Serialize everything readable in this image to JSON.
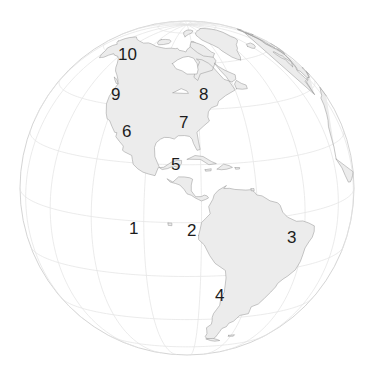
{
  "map": {
    "title": "World globe orthographic projection centered on the Americas",
    "projection": "orthographic",
    "center_lon": -85,
    "center_lat": 12,
    "sphere": {
      "cx": 187,
      "cy": 188,
      "r": 167,
      "fill": "#ffffff",
      "stroke": "#c9c9c9",
      "stroke_width": 0.8
    },
    "graticule": {
      "visible": true,
      "step_lon": 20,
      "step_lat": 20,
      "stroke": "#e2e2e2",
      "stroke_width": 0.7
    },
    "land": {
      "fill": "#ececec",
      "stroke": "#9a9a9a",
      "stroke_width": 0.55
    },
    "background": "#ffffff",
    "label_color": "#1c1c1c",
    "label_font_size": 17
  },
  "labels": [
    {
      "id": "label-1",
      "text": "1",
      "x": 129,
      "y": 220,
      "region": "pacific-ocean"
    },
    {
      "id": "label-2",
      "text": "2",
      "x": 187,
      "y": 222,
      "region": "northwest-south-america"
    },
    {
      "id": "label-3",
      "text": "3",
      "x": 287,
      "y": 229,
      "region": "eastern-brazil"
    },
    {
      "id": "label-4",
      "text": "4",
      "x": 215,
      "y": 287,
      "region": "southern-cone"
    },
    {
      "id": "label-5",
      "text": "5",
      "x": 171,
      "y": 156,
      "region": "central-america-caribbean"
    },
    {
      "id": "label-6",
      "text": "6",
      "x": 122,
      "y": 123,
      "region": "mexico"
    },
    {
      "id": "label-7",
      "text": "7",
      "x": 179,
      "y": 114,
      "region": "southeast-united-states"
    },
    {
      "id": "label-8",
      "text": "8",
      "x": 199,
      "y": 86,
      "region": "northeast-united-states"
    },
    {
      "id": "label-9",
      "text": "9",
      "x": 111,
      "y": 86,
      "region": "pacific-northwest"
    },
    {
      "id": "label-10",
      "text": "10",
      "x": 118,
      "y": 46,
      "region": "alaska"
    }
  ]
}
